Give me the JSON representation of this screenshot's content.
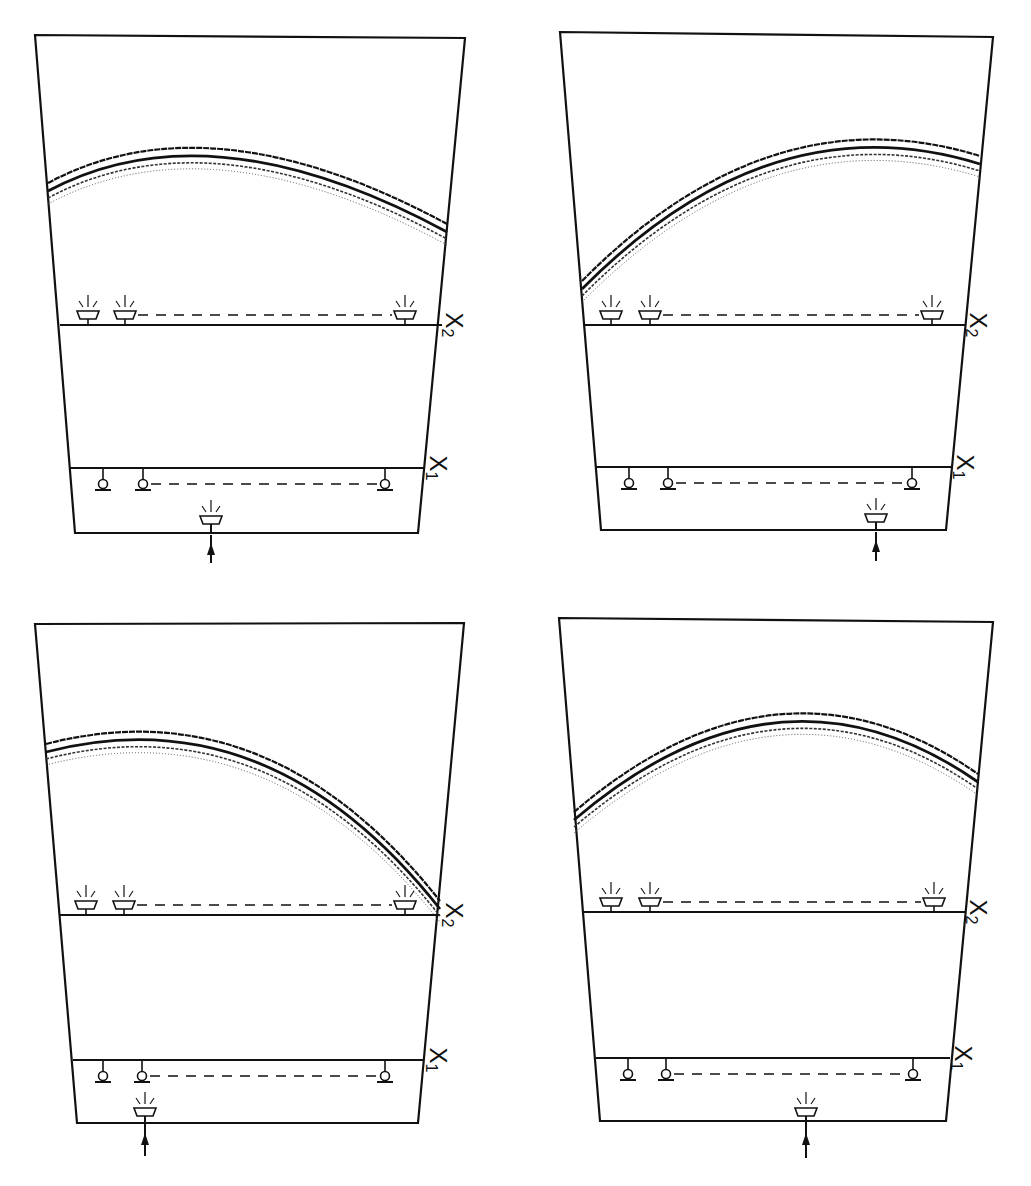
{
  "figure": {
    "panel_count": 4,
    "colors": {
      "ink": "#111111",
      "background": "#ffffff",
      "dotted": "#555555"
    },
    "panels": [
      {
        "id": "top-left",
        "outline": [
          [
            35,
            35
          ],
          [
            465,
            38
          ],
          [
            418,
            533
          ],
          [
            75,
            533
          ]
        ],
        "x2_line": {
          "x1": 60,
          "x2": 442,
          "y": 325,
          "label": "X",
          "label_sub": "2",
          "label_pos": [
            452,
            325
          ]
        },
        "x1_line": {
          "x1": 70,
          "x2": 425,
          "y": 468,
          "label": "X",
          "label_sub": "1",
          "label_pos": [
            436,
            468
          ]
        },
        "wave": {
          "start": [
            48,
            187
          ],
          "ctrl": [
            210,
            100
          ],
          "end": [
            447,
            228
          ]
        },
        "x2_receivers": [
          88,
          125,
          405
        ],
        "x1_receivers": [
          103,
          143,
          385
        ],
        "emitter": {
          "x": 211,
          "y": 516
        },
        "arrow": {
          "x": 211,
          "y_top": 535,
          "y_bottom": 563
        }
      },
      {
        "id": "top-right",
        "outline": [
          [
            560,
            32
          ],
          [
            993,
            37
          ],
          [
            946,
            530
          ],
          [
            601,
            530
          ]
        ],
        "x2_line": {
          "x1": 583,
          "x2": 965,
          "y": 325,
          "label": "X",
          "label_sub": "2",
          "label_pos": [
            976,
            325
          ]
        },
        "x1_line": {
          "x1": 596,
          "x2": 952,
          "y": 467,
          "label": "X",
          "label_sub": "1",
          "label_pos": [
            963,
            467
          ]
        },
        "wave": {
          "start": [
            582,
            285
          ],
          "ctrl": [
            770,
            95
          ],
          "end": [
            980,
            160
          ]
        },
        "x2_receivers": [
          611,
          650,
          932
        ],
        "x1_receivers": [
          629,
          668,
          912
        ],
        "emitter": {
          "x": 876,
          "y": 514
        },
        "arrow": {
          "x": 876,
          "y_top": 532,
          "y_bottom": 561
        }
      },
      {
        "id": "bottom-left",
        "outline": [
          [
            35,
            624
          ],
          [
            464,
            623
          ],
          [
            418,
            1123
          ],
          [
            77,
            1123
          ]
        ],
        "x2_line": {
          "x1": 60,
          "x2": 440,
          "y": 915,
          "label": "X",
          "label_sub": "2",
          "label_pos": [
            452,
            915
          ]
        },
        "x1_line": {
          "x1": 73,
          "x2": 424,
          "y": 1060,
          "label": "X",
          "label_sub": "1",
          "label_pos": [
            436,
            1060
          ]
        },
        "wave": {
          "start": [
            46,
            748
          ],
          "ctrl": [
            270,
            690
          ],
          "end": [
            440,
            905
          ]
        },
        "x2_receivers": [
          86,
          124,
          405
        ],
        "x1_receivers": [
          103,
          142,
          385
        ],
        "emitter": {
          "x": 145,
          "y": 1108
        },
        "arrow": {
          "x": 145,
          "y_top": 1125,
          "y_bottom": 1156
        }
      },
      {
        "id": "bottom-right",
        "outline": [
          [
            559,
            618
          ],
          [
            993,
            622
          ],
          [
            946,
            1121
          ],
          [
            600,
            1121
          ]
        ],
        "x2_line": {
          "x1": 582,
          "x2": 965,
          "y": 912,
          "label": "X",
          "label_sub": "2",
          "label_pos": [
            976,
            912
          ]
        },
        "x1_line": {
          "x1": 596,
          "x2": 950,
          "y": 1058,
          "label": "X",
          "label_sub": "1",
          "label_pos": [
            961,
            1058
          ]
        },
        "wave": {
          "start": [
            574,
            816
          ],
          "ctrl": [
            780,
            640
          ],
          "end": [
            978,
            778
          ]
        },
        "x2_receivers": [
          611,
          650,
          934
        ],
        "x1_receivers": [
          628,
          666,
          913
        ],
        "emitter": {
          "x": 806,
          "y": 1108
        },
        "arrow": {
          "x": 806,
          "y_top": 1125,
          "y_bottom": 1158
        }
      }
    ]
  },
  "labels": {
    "x1": "X",
    "x1_sub": "1",
    "x2": "X",
    "x2_sub": "2"
  },
  "legend_semantics": {
    "emitter_icon": "source-transducer",
    "receiver_x2_icon": "receiver-cup-transducer",
    "receiver_x1_icon": "receiver-bulb-transducer",
    "arrow_icon": "input-arrow"
  }
}
